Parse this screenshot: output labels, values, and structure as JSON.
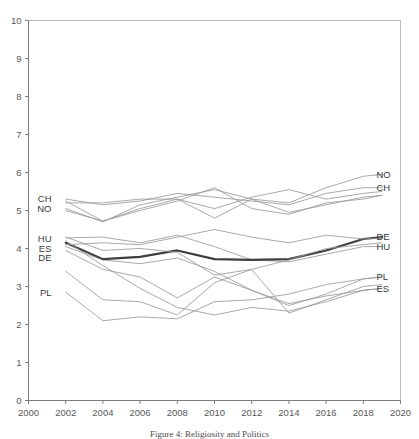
{
  "chart_data": {
    "type": "line",
    "title": "",
    "caption": "Figure 4: Religiosity and Politics",
    "xlabel": "",
    "ylabel": "",
    "xlim": [
      2000,
      2020
    ],
    "ylim": [
      0,
      10
    ],
    "xticks": [
      2000,
      2002,
      2004,
      2006,
      2008,
      2010,
      2012,
      2014,
      2016,
      2018,
      2020
    ],
    "yticks": [
      0,
      1,
      2,
      3,
      4,
      5,
      6,
      7,
      8,
      9,
      10
    ],
    "grid": false,
    "legend_position": "inline-endpoints",
    "x": [
      2002,
      2004,
      2006,
      2008,
      2010,
      2012,
      2014,
      2016,
      2018,
      2019
    ],
    "left_labels": [
      {
        "text": "CH",
        "value": 5.3
      },
      {
        "text": "NO",
        "value": 5.05
      },
      {
        "text": "HU",
        "value": 4.25
      },
      {
        "text": "ES",
        "value": 4.0
      },
      {
        "text": "DE",
        "value": 3.75
      },
      {
        "text": "PL",
        "value": 2.85
      }
    ],
    "right_labels": [
      {
        "text": "NO",
        "value": 5.95
      },
      {
        "text": "CH",
        "value": 5.6
      },
      {
        "text": "DE",
        "value": 4.3
      },
      {
        "text": "HU",
        "value": 4.05
      },
      {
        "text": "PL",
        "value": 3.25
      },
      {
        "text": "ES",
        "value": 2.95
      }
    ],
    "series": [
      {
        "name": "CH",
        "highlight": false,
        "color": "#9a9a9c",
        "values": [
          5.3,
          5.15,
          5.25,
          5.45,
          5.35,
          5.25,
          5.15,
          5.45,
          5.6,
          5.6
        ]
      },
      {
        "name": "NO",
        "highlight": false,
        "color": "#9a9a9c",
        "values": [
          5.05,
          4.7,
          5.15,
          5.35,
          5.55,
          5.3,
          5.2,
          5.6,
          5.9,
          5.95
        ]
      },
      {
        "name": "NL",
        "highlight": false,
        "color": "#9a9a9c",
        "values": [
          5.25,
          4.72,
          5.05,
          5.3,
          5.05,
          5.35,
          5.55,
          5.3,
          5.45,
          5.5
        ]
      },
      {
        "name": "SE",
        "highlight": false,
        "color": "#9a9a9c",
        "values": [
          5.0,
          4.72,
          5.0,
          5.25,
          5.6,
          5.05,
          4.9,
          5.2,
          5.3,
          5.4
        ]
      },
      {
        "name": "GB",
        "highlight": false,
        "color": "#9a9a9c",
        "values": [
          5.2,
          5.2,
          5.3,
          5.3,
          4.8,
          5.3,
          4.95,
          5.15,
          5.35,
          5.4
        ]
      },
      {
        "name": "HU",
        "highlight": false,
        "color": "#9a9a9c",
        "values": [
          4.28,
          4.3,
          4.15,
          4.35,
          4.05,
          3.7,
          3.65,
          3.85,
          4.05,
          4.05
        ]
      },
      {
        "name": "ES",
        "highlight": false,
        "color": "#9a9a9c",
        "values": [
          4.05,
          3.7,
          3.6,
          3.75,
          3.4,
          2.9,
          2.55,
          2.75,
          2.9,
          2.95
        ]
      },
      {
        "name": "DE",
        "highlight": true,
        "color": "#3f3f42",
        "values": [
          4.15,
          3.72,
          3.78,
          3.95,
          3.72,
          3.7,
          3.72,
          3.95,
          4.25,
          4.3
        ]
      },
      {
        "name": "FR",
        "highlight": false,
        "color": "#9a9a9c",
        "values": [
          4.1,
          4.15,
          4.1,
          4.3,
          4.5,
          4.3,
          4.15,
          4.35,
          4.25,
          4.28
        ]
      },
      {
        "name": "AT",
        "highlight": false,
        "color": "#9a9a9c",
        "values": [
          4.3,
          3.95,
          4.0,
          3.9,
          3.3,
          3.45,
          3.7,
          4.0,
          4.1,
          4.15
        ]
      },
      {
        "name": "PT",
        "highlight": false,
        "color": "#9a9a9c",
        "values": [
          3.95,
          3.45,
          3.25,
          2.7,
          3.25,
          2.9,
          2.5,
          2.8,
          3.2,
          3.25
        ]
      },
      {
        "name": "CZ",
        "highlight": false,
        "color": "#9a9a9c",
        "values": [
          3.4,
          2.65,
          2.6,
          2.25,
          3.1,
          3.45,
          2.3,
          2.65,
          3.0,
          3.05
        ]
      },
      {
        "name": "PL",
        "highlight": false,
        "color": "#9a9a9c",
        "values": [
          2.85,
          2.1,
          2.2,
          2.15,
          2.6,
          2.65,
          2.8,
          3.05,
          3.2,
          3.25
        ]
      },
      {
        "name": "IE",
        "highlight": false,
        "color": "#9a9a9c",
        "values": [
          4.2,
          3.55,
          2.95,
          2.45,
          2.25,
          2.45,
          2.35,
          2.6,
          2.9,
          2.95
        ]
      }
    ]
  }
}
